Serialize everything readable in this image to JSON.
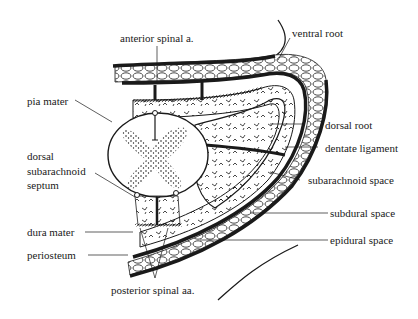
{
  "diagram": {
    "type": "anatomical cross-section",
    "ink_color": "#1a1a1a",
    "background": "#ffffff",
    "labels": {
      "anterior_spinal_a": "anterior spinal a.",
      "ventral_root": "ventral root",
      "pia_mater": "pia mater",
      "dorsal_root": "dorsal root",
      "dentate_ligament": "dentate ligament",
      "dorsal_septum_line1": "dorsal",
      "dorsal_septum_line2": "subarachnoid",
      "dorsal_septum_line3": "septum",
      "subarachnoid_space": "subarachnoid space",
      "subdural_space": "subdural space",
      "dura_mater": "dura mater",
      "epidural_space": "epidural space",
      "periosteum": "periosteum",
      "posterior_spinal_aa": "posterior spinal aa."
    }
  }
}
